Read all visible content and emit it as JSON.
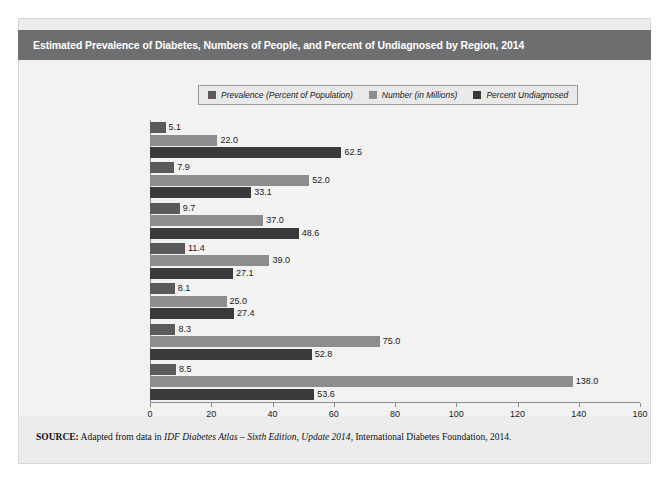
{
  "figure": {
    "title": "Estimated Prevalence of Diabetes, Numbers of People, and Percent of Undiagnosed by Region, 2014",
    "source_prefix": "SOURCE:",
    "source_text_1": " Adapted from data in ",
    "source_italic_1": "IDF Diabetes Atlas – Sixth Edition, Update 2014",
    "source_text_2": ", International Diabetes Foundation, 2014."
  },
  "colors": {
    "title_bar": "#6d6e70",
    "panel_bg": "#ececed",
    "chart_bg": "#f2f2f2",
    "series_prevalence": "#5a5a5c",
    "series_number": "#8d8d8f",
    "series_undiagnosed": "#3a3a3c",
    "axis": "#8d8d8f"
  },
  "legend": {
    "items": [
      {
        "label": "Prevalence (Percent of Population)",
        "color": "#5a5a5c"
      },
      {
        "label": "Number (in Millions)",
        "color": "#8d8d8f"
      },
      {
        "label": "Percent Undiagnosed",
        "color": "#3a3a3c"
      }
    ]
  },
  "chart_data": {
    "type": "bar",
    "orientation": "horizontal",
    "title": "Estimated Prevalence of Diabetes, Numbers of People, and Percent of Undiagnosed by Region, 2014",
    "xlabel": "",
    "ylabel": "",
    "xlim": [
      0,
      160
    ],
    "xticks": [
      0,
      20,
      40,
      60,
      80,
      100,
      120,
      140,
      160
    ],
    "grid": false,
    "legend_position": "top-center",
    "categories": [
      "Africa",
      "Europe",
      "Middle East and North Africa",
      "North America and Caribbean",
      "South and Central America",
      "South-East Asia",
      "Western Pacific"
    ],
    "series": [
      {
        "name": "Prevalence (Percent of Population)",
        "color": "#5a5a5c",
        "values": [
          5.1,
          7.9,
          9.7,
          11.4,
          8.1,
          8.3,
          8.5
        ],
        "labels": [
          "5.1",
          "7.9",
          "9.7",
          "11.4",
          "8.1",
          "8.3",
          "8.5"
        ]
      },
      {
        "name": "Number (in Millions)",
        "color": "#8d8d8f",
        "values": [
          22.0,
          52.0,
          37.0,
          39.0,
          25.0,
          75.0,
          138.0
        ],
        "labels": [
          "22.0",
          "52.0",
          "37.0",
          "39.0",
          "25.0",
          "75.0",
          "138.0"
        ]
      },
      {
        "name": "Percent Undiagnosed",
        "color": "#3a3a3c",
        "values": [
          62.5,
          33.1,
          48.6,
          27.1,
          27.4,
          52.8,
          53.6
        ],
        "labels": [
          "62.5",
          "33.1",
          "48.6",
          "27.1",
          "27.4",
          "52.8",
          "53.6"
        ]
      }
    ]
  }
}
